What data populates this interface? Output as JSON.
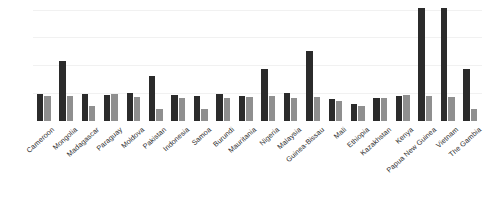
{
  "chart_data": {
    "type": "bar",
    "title": "",
    "subtitle": "",
    "xlabel": "",
    "ylabel": "",
    "ylim": [
      0,
      126
    ],
    "grid": true,
    "gridlines": [
      29,
      58,
      87,
      116
    ],
    "legend_position": "none",
    "categories": [
      "Cameroon",
      "Mongolia",
      "Madagascar",
      "Paraguay",
      "Moldova",
      "Pakistan",
      "Indonesia",
      "Samoa",
      "Burundi",
      "Mauritania",
      "Nigeria",
      "Malaysia",
      "Guinea-Bissau",
      "Mali",
      "Ethiopia",
      "Kazakhstan",
      "Kenya",
      "Papua New Guinea",
      "Vietnam",
      "The Gambia"
    ],
    "series": [
      {
        "name": "Series 1",
        "color": "#2b2b2b",
        "values": [
          28,
          62,
          28,
          27,
          29,
          47,
          27,
          26,
          28,
          26,
          54,
          29,
          73,
          23,
          18,
          24,
          26,
          118,
          118,
          54
        ]
      },
      {
        "name": "Series 2",
        "color": "#8f8f8f",
        "values": [
          26,
          26,
          16,
          28,
          25,
          13,
          24,
          12,
          24,
          25,
          26,
          24,
          25,
          21,
          16,
          24,
          27,
          26,
          25,
          12
        ]
      }
    ]
  },
  "colors": {
    "background": "#ffffff",
    "gridline": "#f1f1f1",
    "series_dark": "#2b2b2b",
    "series_light": "#8f8f8f",
    "label_text": "#2e2e2e"
  }
}
